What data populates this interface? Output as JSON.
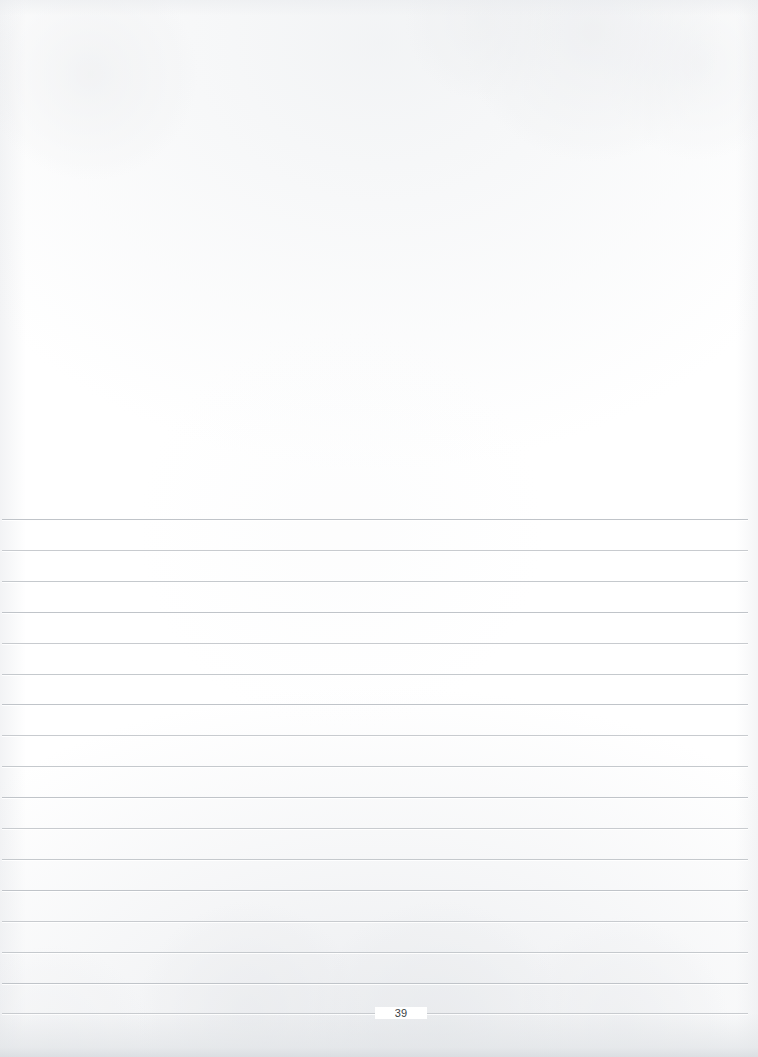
{
  "document": {
    "type": "scanned-lined-page",
    "page_number": "39",
    "background_color": "#ffffff",
    "rule_color": "#c4c8cc",
    "text_color": "#3a3f44",
    "width": 758,
    "height": 1057,
    "blank_area": {
      "label": "",
      "top": 0,
      "height": 519
    },
    "rules": {
      "count": 17,
      "first_y": 519,
      "spacing": 30.9,
      "left": 2,
      "right": 748
    },
    "page_number_position": {
      "x": 395,
      "y": 1013
    },
    "content_lines": [
      "",
      "",
      "",
      "",
      "",
      "",
      "",
      "",
      "",
      "",
      "",
      "",
      "",
      "",
      "",
      "",
      ""
    ]
  }
}
